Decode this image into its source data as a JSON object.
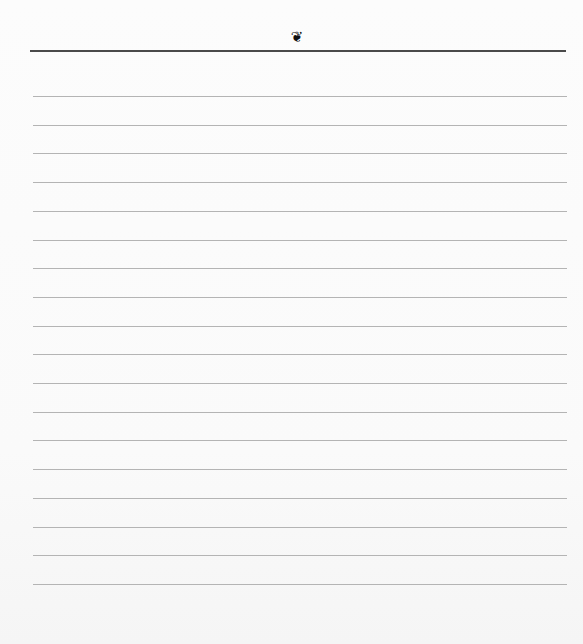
{
  "document": {
    "type": "ruled-notebook-page",
    "header": {
      "ornament_icon": "floral-heart-icon",
      "ornament_glyph": "❦"
    },
    "ruled_lines": {
      "count": 18,
      "first_y": 96,
      "spacing": 28.7
    },
    "colors": {
      "background": "#fbfbfb",
      "header_rule": "#4a4a4a",
      "ruled_line": "#b4b4b4",
      "ornament": "#111111"
    }
  }
}
